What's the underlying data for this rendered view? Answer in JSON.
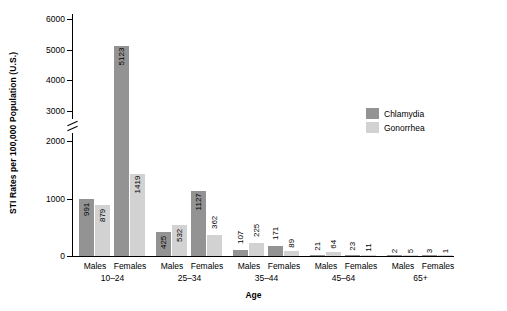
{
  "chart_data": {
    "type": "bar",
    "title": "",
    "xlabel": "Age",
    "ylabel": "STI Rates per 100,000 Population (U.S.)",
    "ylim": [
      0,
      6000
    ],
    "yticks": [
      "0",
      "1000",
      "2000",
      "3000",
      "4000",
      "5000",
      "6000"
    ],
    "grid": false,
    "axis_break": true,
    "legend_position": "right",
    "categories": [
      "Males 10–24",
      "Females 10–24",
      "Males 25–34",
      "Females 25–34",
      "Males 35–44",
      "Females 35–44",
      "Males 45–64",
      "Females 45–64",
      "Males 65+",
      "Females 65+"
    ],
    "age_groups": [
      "10–24",
      "25–34",
      "35–44",
      "45–64",
      "65+"
    ],
    "sex_labels": [
      "Males",
      "Females"
    ],
    "series": [
      {
        "name": "Chlamydia",
        "color": "#939393",
        "values": [
          991,
          5123,
          425,
          1127,
          107,
          171,
          21,
          23,
          2,
          3
        ]
      },
      {
        "name": "Gonorrhea",
        "color": "#d2d2d2",
        "values": [
          879,
          1419,
          532,
          362,
          225,
          89,
          64,
          11,
          5,
          1
        ]
      }
    ]
  },
  "legend": {
    "items": [
      {
        "label": "Chlamydia",
        "color": "#939393"
      },
      {
        "label": "Gonorrhea",
        "color": "#d2d2d2"
      }
    ]
  }
}
